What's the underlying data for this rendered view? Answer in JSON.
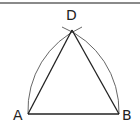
{
  "diagram": {
    "type": "geometric-construction",
    "points": [
      {
        "label": "A",
        "x": 28,
        "y": 114
      },
      {
        "label": "B",
        "x": 119,
        "y": 114
      },
      {
        "label": "D",
        "x": 72,
        "y": 30
      }
    ],
    "segments": [
      [
        "A",
        "B"
      ],
      [
        "A",
        "D"
      ],
      [
        "B",
        "D"
      ]
    ],
    "arcs": [
      {
        "center": "A",
        "through": "D"
      },
      {
        "center": "B",
        "through": "D"
      }
    ],
    "colors": {
      "stroke": "#222222",
      "arc": "#555555",
      "rule": "#8a8a8a"
    }
  },
  "labels": {
    "A": "A",
    "B": "B",
    "D": "D"
  }
}
